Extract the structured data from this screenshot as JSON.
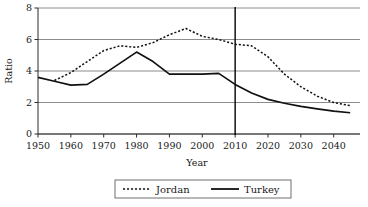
{
  "chart_data": {
    "type": "line",
    "title": "",
    "xlabel": "Year",
    "ylabel": "Ratio",
    "xlim": [
      1950,
      2048
    ],
    "ylim": [
      0,
      8
    ],
    "xticks": [
      1950,
      1960,
      1970,
      1980,
      1990,
      2000,
      2010,
      2020,
      2030,
      2040
    ],
    "yticks": [
      0,
      2,
      4,
      6,
      8
    ],
    "grid": "horizontal",
    "legend_position": "bottom-center",
    "annotations": [
      {
        "name": "present-year-marker",
        "type": "vline",
        "x": 2010
      }
    ],
    "series": [
      {
        "name": "Jordan",
        "style": "dotted",
        "x": [
          1955,
          1960,
          1965,
          1970,
          1975,
          1980,
          1985,
          1990,
          1995,
          2000,
          2005,
          2010,
          2015,
          2020,
          2025,
          2030,
          2035,
          2040,
          2045
        ],
        "values": [
          3.4,
          3.9,
          4.6,
          5.3,
          5.6,
          5.5,
          5.8,
          6.3,
          6.7,
          6.2,
          6.0,
          5.7,
          5.6,
          4.9,
          3.8,
          3.0,
          2.4,
          2.0,
          1.8
        ]
      },
      {
        "name": "Turkey",
        "style": "solid",
        "x": [
          1950,
          1955,
          1960,
          1965,
          1970,
          1975,
          1980,
          1985,
          1990,
          1995,
          2000,
          2005,
          2010,
          2015,
          2020,
          2025,
          2030,
          2035,
          2040,
          2045
        ],
        "values": [
          3.6,
          3.35,
          3.1,
          3.15,
          3.8,
          4.5,
          5.2,
          4.6,
          3.8,
          3.8,
          3.8,
          3.85,
          3.15,
          2.6,
          2.2,
          1.95,
          1.75,
          1.6,
          1.45,
          1.35
        ]
      }
    ]
  },
  "axis": {
    "y_title": "Ratio",
    "x_title": "Year",
    "x_tick_labels": [
      "1950",
      "1960",
      "1970",
      "1980",
      "1990",
      "2000",
      "2010",
      "2020",
      "2030",
      "2040"
    ],
    "y_tick_labels": [
      "0",
      "2",
      "4",
      "6",
      "8"
    ]
  },
  "legend": {
    "entries": [
      {
        "label": "Jordan",
        "style": "dotted"
      },
      {
        "label": "Turkey",
        "style": "solid"
      }
    ]
  },
  "colors": {
    "line": "#111111",
    "grid": "#8c8c8c",
    "axis": "#2b2b2b",
    "background": "#ffffff"
  }
}
